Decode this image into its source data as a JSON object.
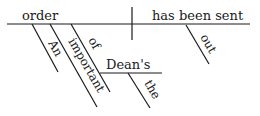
{
  "diagram": {
    "type": "sentence-diagram",
    "subject": "order",
    "predicate": "has been sent",
    "modifiers": {
      "subject_modifiers": [
        {
          "word": "An",
          "role": "article"
        },
        {
          "word": "important",
          "role": "adjective"
        },
        {
          "word": "of",
          "role": "preposition",
          "object": "Dean's",
          "object_modifiers": [
            {
              "word": "the",
              "role": "article"
            }
          ]
        }
      ],
      "predicate_modifiers": [
        {
          "word": "out",
          "role": "adverb"
        }
      ]
    },
    "labels": {
      "subject": "order",
      "predicate": "has been sent",
      "an": "An",
      "important": "important",
      "of": "of",
      "deans": "Dean's",
      "the": "the",
      "out": "out"
    }
  }
}
